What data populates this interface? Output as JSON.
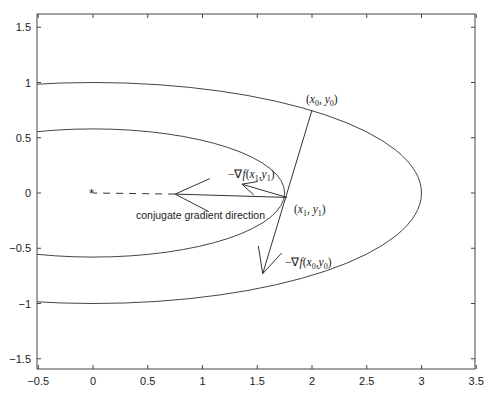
{
  "chart_data": {
    "type": "line",
    "title": "",
    "xlabel": "",
    "ylabel": "",
    "xlim": [
      -0.5,
      3.5
    ],
    "ylim": [
      -1.6,
      1.6
    ],
    "grid": false,
    "legend": null,
    "x_ticks": [
      "-0.5",
      "0",
      "0.5",
      "1",
      "1.5",
      "2",
      "2.5",
      "3",
      "3.5"
    ],
    "y_ticks": [
      "1.5",
      "1",
      "0.5",
      "0",
      "-0.5",
      "-1",
      "-1.5"
    ],
    "series": [
      {
        "name": "outer contour ellipse",
        "shape": "ellipse",
        "center": [
          0,
          0
        ],
        "semi_axis_x": 3.0,
        "semi_axis_y": 1.0
      },
      {
        "name": "inner contour ellipse",
        "shape": "ellipse",
        "center": [
          0,
          0
        ],
        "semi_axis_x": 1.75,
        "semi_axis_y": 0.58
      }
    ],
    "points": {
      "minimum": {
        "x": 0,
        "y": 0,
        "marker": "*"
      },
      "x0_y0": {
        "x": 2.0,
        "y": 0.75
      },
      "x1_y1": {
        "x": 1.77,
        "y": -0.04
      }
    },
    "vectors": [
      {
        "name": "-grad f(x0,y0)",
        "from": [
          2.0,
          0.75
        ],
        "to": [
          1.55,
          -0.73
        ]
      },
      {
        "name": "-grad f(x1,y1)",
        "from": [
          1.77,
          -0.04
        ],
        "to": [
          1.36,
          0.08
        ]
      },
      {
        "name": "conjugate gradient direction",
        "from": [
          1.77,
          -0.04
        ],
        "to": [
          0.75,
          -0.01
        ]
      },
      {
        "name": "dashed extension to minimum",
        "from": [
          0.75,
          -0.01
        ],
        "to": [
          0,
          0
        ],
        "style": "dashed"
      }
    ],
    "annotations": {
      "x0_label": "(x0, y0)",
      "x1_label": "(x1, y1)",
      "grad_x0_label": "−∇f(x0,y0)",
      "grad_x1_label": "−∇f(x1,y1)",
      "conj_label": "conjugate gradient direction"
    }
  },
  "labels": {
    "x0_open": "(",
    "x0_x": "x",
    "x0_sub": "0",
    "x0_mid": ", ",
    "x0_y": "y",
    "x0_close": ")",
    "x1_x": "x",
    "x1_sub": "1",
    "x1_y": "y",
    "nabla_prefix": "−∇",
    "f": "f",
    "conj": "conjugate gradient direction",
    "star": "*"
  }
}
